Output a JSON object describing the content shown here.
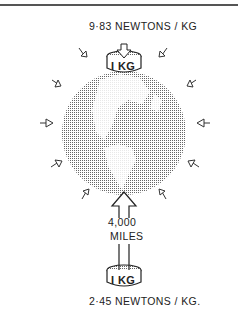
{
  "diagram": {
    "top_label": "9·83 NEWTONS / KG",
    "distance_line1": "4,000",
    "distance_line2": "MILES",
    "bottom_label": "2·45 NEWTONS / KG.",
    "top_weight_label": "I KG",
    "bottom_weight_label": "I KG"
  }
}
